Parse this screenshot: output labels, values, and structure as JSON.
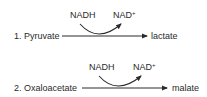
{
  "reactions": [
    {
      "number": "1.",
      "substrate": "Pyruvate",
      "product": "lactate",
      "cofactor_in": "NADH",
      "cofactor_out": "NAD",
      "cofactor_out_sup": "+"
    },
    {
      "number": "2.",
      "substrate": "Oxaloacetate",
      "product": "malate",
      "cofactor_in": "NADH",
      "cofactor_out": "NAD",
      "cofactor_out_sup": "+"
    }
  ],
  "colors": {
    "ink": "#2a2a2a",
    "background": "#ffffff"
  }
}
